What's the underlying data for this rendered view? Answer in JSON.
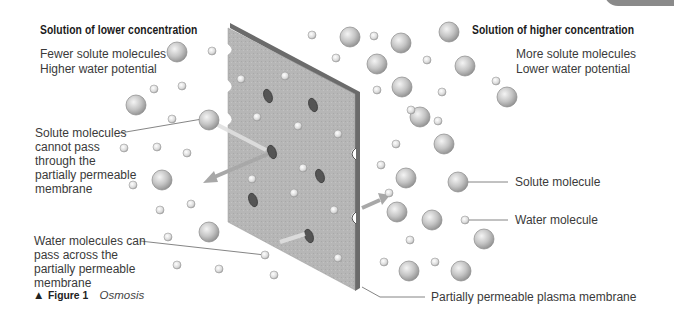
{
  "left_panel": {
    "heading": "Solution of lower concentration",
    "line1": "Fewer solute molecules",
    "line2": "Higher water potential"
  },
  "right_panel": {
    "heading": "Solution of higher concentration",
    "line1": "More solute molecules",
    "line2": "Lower water potential"
  },
  "annotations": {
    "solute_cannot_pass": [
      "Solute molecules",
      "cannot pass",
      "through the",
      "partially permeable",
      "membrane"
    ],
    "water_can_pass": [
      "Water molecules can",
      "pass across the",
      "partially permeable",
      "membrane"
    ],
    "solute_molecule": "Solute molecule",
    "water_molecule": "Water molecule",
    "membrane": "Partially permeable plasma membrane"
  },
  "caption": {
    "marker": "▲",
    "figure": "Figure 1",
    "title": "Osmosis"
  },
  "colors": {
    "membrane_face": "#b4b4b4",
    "membrane_edge": "#6e6e6e",
    "molecule": "#c8c8c8",
    "arrow": "#a9a9a9",
    "text": "#3a3a3a"
  }
}
